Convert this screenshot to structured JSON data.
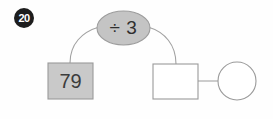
{
  "item": {
    "number_label": "20",
    "type": "function-machine-diagram"
  },
  "diagram": {
    "input_box": {
      "value": "79",
      "fill_color": "#c9c9c9",
      "stroke_color": "#9a9a9a"
    },
    "operation_bubble": {
      "label": "÷ 3",
      "fill_color": "#c4c4c4",
      "stroke_color": "#9d9d9d"
    },
    "output_box": {
      "value": "",
      "fill_color": "#ffffff",
      "stroke_color": "#9a9a9a"
    },
    "result_circle": {
      "value": "",
      "fill_color": "#ffffff",
      "stroke_color": "#9a9a9a"
    },
    "connectors": {
      "left_arc": "input-box-to-operation",
      "right_arc": "operation-to-output-box",
      "straight_line": "output-box-to-result-circle"
    }
  },
  "colors": {
    "background": "#fefefe",
    "badge_background": "#1d1d1d",
    "badge_text": "#ffffff",
    "line": "#a2a2a2",
    "text": "#3a3a3a"
  }
}
